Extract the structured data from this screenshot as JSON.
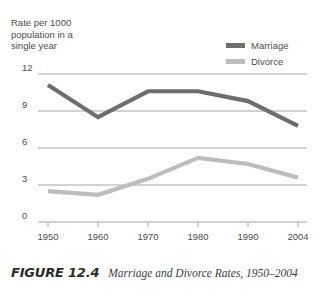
{
  "chart_data": {
    "type": "line",
    "title": "",
    "ylabel": "Rate per 1000\npopulation in a\nsingle year",
    "xlabel": "",
    "categories": [
      "1950",
      "1960",
      "1970",
      "1980",
      "1990",
      "2004"
    ],
    "x": [
      1950,
      1960,
      1970,
      1980,
      1990,
      2004
    ],
    "series": [
      {
        "name": "Marriage",
        "color": "#6e6e6e",
        "values": [
          11.1,
          8.5,
          10.6,
          10.6,
          9.8,
          7.8
        ]
      },
      {
        "name": "Divorce",
        "color": "#bdbdbd",
        "values": [
          2.5,
          2.2,
          3.5,
          5.2,
          4.7,
          3.6
        ]
      }
    ],
    "ylim": [
      0,
      12
    ],
    "yticks": [
      "0",
      "3",
      "6",
      "9",
      "12"
    ],
    "ytick_values": [
      0,
      3,
      6,
      9,
      12
    ],
    "grid": true,
    "legend_position": "top-right"
  },
  "legend": {
    "entries": [
      {
        "label": "Marriage"
      },
      {
        "label": "Divorce"
      }
    ]
  },
  "caption": {
    "figure_number": "FIGURE 12.4",
    "text": "Marriage and Divorce Rates, 1950–2004"
  },
  "colors": {
    "marriage": "#6e6e6e",
    "divorce": "#bdbdbd",
    "gridline": "#9a9a9a",
    "text": "#4d4d4d"
  }
}
